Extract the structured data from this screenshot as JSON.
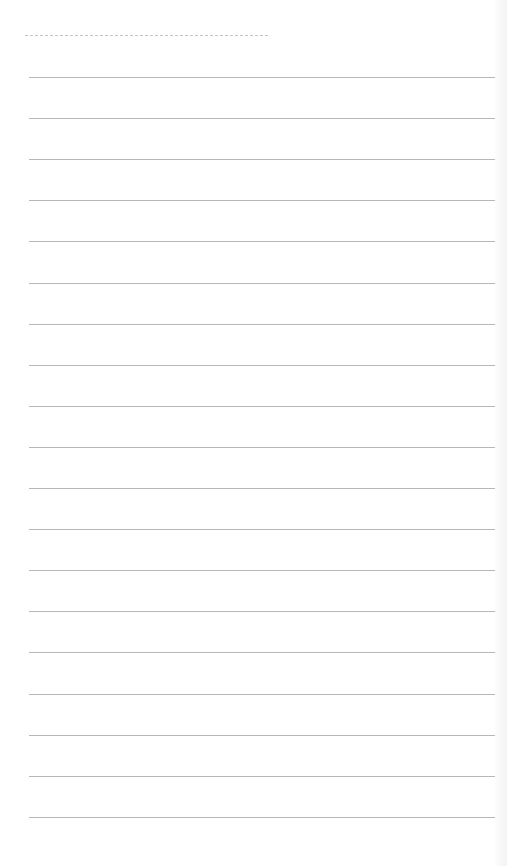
{
  "page": {
    "type": "lined-notebook-page",
    "background_color": "#ffffff",
    "line_color": "#aaaaaa",
    "header_dash_color": "#c4c4c4",
    "rule_count": 19,
    "first_rule_y": 77,
    "rule_spacing": 41.1,
    "rule_left": 29,
    "rule_width": 466
  },
  "header": {
    "date_line": ""
  },
  "lines": [
    "",
    "",
    "",
    "",
    "",
    "",
    "",
    "",
    "",
    "",
    "",
    "",
    "",
    "",
    "",
    "",
    "",
    "",
    ""
  ]
}
